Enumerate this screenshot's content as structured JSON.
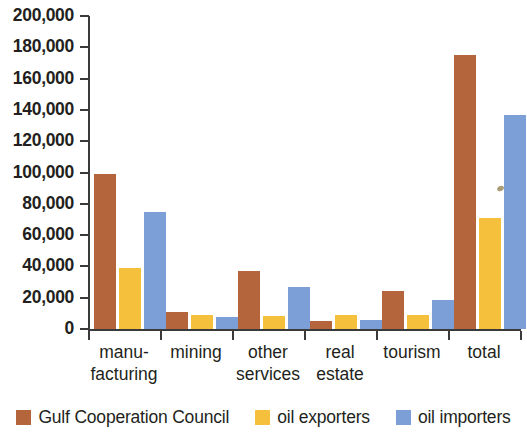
{
  "chart_data": {
    "type": "bar",
    "title": "",
    "xlabel": "",
    "ylabel": "",
    "ylim": [
      0,
      200000
    ],
    "ytick_step": 20000,
    "grid": false,
    "legend_position": "bottom",
    "ytick_labels": [
      "200,000",
      "180,000",
      "160,000",
      "140,000",
      "120,000",
      "100,000",
      "80,000",
      "60,000",
      "40,000",
      "20,000",
      "0"
    ],
    "ytick_values": [
      200000,
      180000,
      160000,
      140000,
      120000,
      100000,
      80000,
      60000,
      40000,
      20000,
      0
    ],
    "categories": [
      "manu-\nfacturing",
      "mining",
      "other\nservices",
      "real\nestate",
      "tourism",
      "total"
    ],
    "series": [
      {
        "name": "Gulf Cooperation Council",
        "color": "#b5653c",
        "values": [
          99000,
          11000,
          37000,
          5000,
          24000,
          175000
        ]
      },
      {
        "name": "oil exporters",
        "color": "#f5c03c",
        "values": [
          39000,
          9000,
          8000,
          9000,
          9000,
          71000
        ]
      },
      {
        "name": "oil importers",
        "color": "#7d9fd8",
        "values": [
          75000,
          7500,
          27000,
          6000,
          18500,
          137000
        ]
      }
    ]
  },
  "legend": {
    "items": [
      {
        "label": "Gulf Cooperation Council",
        "color": "#b5653c"
      },
      {
        "label": "oil exporters",
        "color": "#f5c03c"
      },
      {
        "label": "oil importers",
        "color": "#7d9fd8"
      }
    ]
  }
}
